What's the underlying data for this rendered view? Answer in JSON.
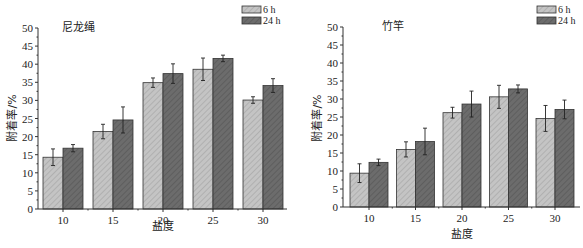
{
  "chart_data": [
    {
      "type": "bar",
      "title": "尼龙绳",
      "xlabel": "盐度",
      "ylabel": "附着率/%",
      "categories": [
        "10",
        "15",
        "20",
        "25",
        "30"
      ],
      "ylim": [
        0,
        50
      ],
      "yticks": [
        0,
        5,
        10,
        15,
        20,
        25,
        30,
        35,
        40,
        45,
        50
      ],
      "grid": false,
      "legend": "top-right",
      "series": [
        {
          "name": "6 h",
          "color": "#c4c4c4",
          "values": [
            14.3,
            21.4,
            34.9,
            38.6,
            30.1
          ],
          "errors": [
            2.3,
            2.0,
            1.3,
            3.1,
            0.9
          ]
        },
        {
          "name": "24 h",
          "color": "#6c6c6c",
          "values": [
            16.8,
            24.6,
            37.4,
            41.6,
            34.1
          ],
          "errors": [
            1.0,
            3.6,
            2.7,
            0.9,
            1.9
          ]
        }
      ]
    },
    {
      "type": "bar",
      "title": "竹竿",
      "xlabel": "盐度",
      "ylabel": "附着率/%",
      "categories": [
        "10",
        "15",
        "20",
        "25",
        "30"
      ],
      "ylim": [
        0,
        50
      ],
      "yticks": [
        0,
        5,
        10,
        15,
        20,
        25,
        30,
        35,
        40,
        45,
        50
      ],
      "grid": false,
      "legend": "top-right",
      "series": [
        {
          "name": "6 h",
          "color": "#c4c4c4",
          "values": [
            9.4,
            16.0,
            26.2,
            30.6,
            24.6
          ],
          "errors": [
            2.6,
            2.1,
            1.5,
            3.2,
            3.6
          ]
        },
        {
          "name": "24 h",
          "color": "#6c6c6c",
          "values": [
            12.4,
            18.2,
            28.6,
            32.8,
            27.1
          ],
          "errors": [
            0.9,
            3.7,
            3.6,
            1.1,
            2.6
          ]
        }
      ]
    }
  ]
}
